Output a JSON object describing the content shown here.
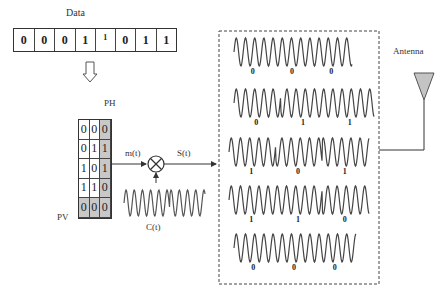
{
  "title": "Data",
  "data_bits": [
    "0",
    "0",
    "0",
    "1",
    "1",
    "0",
    "1",
    "1"
  ],
  "parity_table": {
    "ph_label": "PH",
    "pv_label": "PV",
    "rows": [
      [
        "0",
        "0",
        "0"
      ],
      [
        "0",
        "1",
        "1"
      ],
      [
        "1",
        "0",
        "1"
      ],
      [
        "1",
        "1",
        "0"
      ],
      [
        "0",
        "0",
        "0"
      ]
    ],
    "shaded_column": 2,
    "shaded_row": 4
  },
  "signals": {
    "message": "m(t)",
    "output": "S(t)",
    "carrier": "C(t)"
  },
  "antenna_label": "Antenna",
  "modulated_waves": [
    {
      "bits": [
        "0",
        "0",
        "0"
      ]
    },
    {
      "bits": [
        "0",
        "1",
        "1"
      ]
    },
    {
      "bits": [
        "1",
        "0",
        "1"
      ]
    },
    {
      "bits": [
        "1",
        "1",
        "0"
      ]
    },
    {
      "bits": [
        "0",
        "0",
        "0"
      ]
    }
  ],
  "colors": {
    "line": "#333333",
    "shade": "#c8c8c8",
    "wave": "#444444"
  }
}
